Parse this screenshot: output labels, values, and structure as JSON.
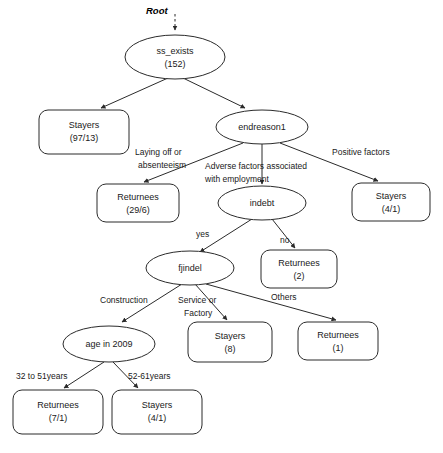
{
  "diagram": {
    "root_label": "Root",
    "background_color": "#ffffff",
    "stroke_color": "#2b2b2b",
    "text_color": "#1a1a1a"
  },
  "nodes": {
    "ss_exists": {
      "label": "ss_exists",
      "value": "(152)",
      "shape": "ellipse"
    },
    "stayers_97_13": {
      "label": "Stayers",
      "value": "(97/13)",
      "shape": "rounded-rect"
    },
    "endreason1": {
      "label": "endreason1",
      "value": "",
      "shape": "ellipse"
    },
    "returnees_29_6": {
      "label": "Returnees",
      "value": "(29/6)",
      "shape": "rounded-rect"
    },
    "indebt": {
      "label": "indebt",
      "value": "",
      "shape": "ellipse"
    },
    "stayers_4_1_top": {
      "label": "Stayers",
      "value": "(4/1)",
      "shape": "rounded-rect"
    },
    "fjindel": {
      "label": "fjindel",
      "value": "",
      "shape": "ellipse"
    },
    "returnees_2": {
      "label": "Returnees",
      "value": "(2)",
      "shape": "rounded-rect"
    },
    "age_in_2009": {
      "label": "age in 2009",
      "value": "",
      "shape": "ellipse"
    },
    "stayers_8": {
      "label": "Stayers",
      "value": "(8)",
      "shape": "rounded-rect"
    },
    "returnees_1": {
      "label": "Returnees",
      "value": "(1)",
      "shape": "rounded-rect"
    },
    "returnees_7_1": {
      "label": "Returnees",
      "value": "(7/1)",
      "shape": "rounded-rect"
    },
    "stayers_4_1_bottom": {
      "label": "Stayers",
      "value": "(4/1)",
      "shape": "rounded-rect"
    }
  },
  "edge_labels": {
    "laying_off_line1": "Laying off or",
    "laying_off_line2": "absenteeism",
    "adverse_line1": "Adverse factors associated",
    "adverse_line2": "with employment",
    "positive_factors": "Positive factors",
    "yes": "yes",
    "no": "no",
    "construction": "Construction",
    "service_line1": "Service or",
    "service_line2": "Factory",
    "others": "Others",
    "age_32_51": "32 to 51years",
    "age_52_61": "52-61years"
  }
}
